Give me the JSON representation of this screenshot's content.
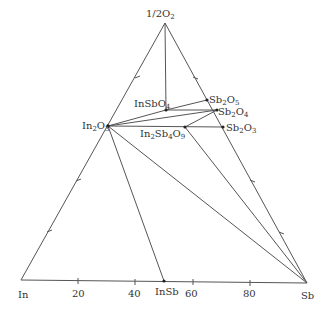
{
  "diagram": {
    "vertices": {
      "top": {
        "label": "1/2O",
        "sub": "2"
      },
      "left": {
        "label": "In"
      },
      "right": {
        "label": "Sb"
      }
    },
    "axis_ticks": [
      "20",
      "40",
      "60",
      "80"
    ],
    "phases": [
      {
        "id": "In2O3",
        "parts": [
          [
            "In",
            ""
          ],
          [
            "2",
            "sub"
          ],
          [
            "O",
            ""
          ],
          [
            "3",
            "sub"
          ]
        ]
      },
      {
        "id": "InSbO4",
        "parts": [
          [
            "InSbO",
            ""
          ],
          [
            "4",
            "sub"
          ]
        ]
      },
      {
        "id": "Sb2O5",
        "parts": [
          [
            "Sb",
            ""
          ],
          [
            "2",
            "sub"
          ],
          [
            "O",
            ""
          ],
          [
            "5",
            "sub"
          ]
        ]
      },
      {
        "id": "Sb2O4",
        "parts": [
          [
            "Sb",
            ""
          ],
          [
            "2",
            "sub"
          ],
          [
            "O",
            ""
          ],
          [
            "4",
            "sub"
          ]
        ]
      },
      {
        "id": "Sb2O3",
        "parts": [
          [
            "Sb",
            ""
          ],
          [
            "2",
            "sub"
          ],
          [
            "O",
            ""
          ],
          [
            "3",
            "sub"
          ]
        ]
      },
      {
        "id": "In2Sb4O9",
        "parts": [
          [
            "In",
            ""
          ],
          [
            "2",
            "sub"
          ],
          [
            "Sb",
            ""
          ],
          [
            "4",
            "sub"
          ],
          [
            "O",
            ""
          ],
          [
            "9",
            "sub"
          ]
        ]
      },
      {
        "id": "InSb",
        "parts": [
          [
            "InSb",
            ""
          ]
        ]
      }
    ],
    "labels": {
      "top": "1/2O",
      "top_sub": "2",
      "in": "In",
      "sb": "Sb",
      "insb": "InSb",
      "tick_20": "20",
      "tick_40": "40",
      "tick_60": "60",
      "tick_80": "80",
      "in2o3_a": "In",
      "in2o3_b": "2",
      "in2o3_c": "O",
      "in2o3_d": "3",
      "insbo4_a": "InSbO",
      "insbo4_b": "4",
      "sb2o5_a": "Sb",
      "sb2o5_b": "2",
      "sb2o5_c": "O",
      "sb2o5_d": "5",
      "sb2o4_a": "Sb",
      "sb2o4_b": "2",
      "sb2o4_c": "O",
      "sb2o4_d": "4",
      "sb2o3_a": "Sb",
      "sb2o3_b": "2",
      "sb2o3_c": "O",
      "sb2o3_d": "3",
      "in2sb4o9_a": "In",
      "in2sb4o9_b": "2",
      "in2sb4o9_c": "Sb",
      "in2sb4o9_d": "4",
      "in2sb4o9_e": "O",
      "in2sb4o9_f": "9"
    },
    "tie_lines": [
      [
        "1/2O2",
        "InSbO4"
      ],
      [
        "InSbO4",
        "Sb2O5"
      ],
      [
        "InSbO4",
        "Sb2O4"
      ],
      [
        "In2O3",
        "InSbO4"
      ],
      [
        "In2O3",
        "Sb2O4"
      ],
      [
        "In2O3",
        "Sb2O3"
      ],
      [
        "Sb2O4",
        "In2Sb4O9"
      ],
      [
        "In2O3",
        "InSb"
      ],
      [
        "In2O3",
        "Sb"
      ],
      [
        "In2Sb4O9",
        "Sb"
      ]
    ]
  }
}
